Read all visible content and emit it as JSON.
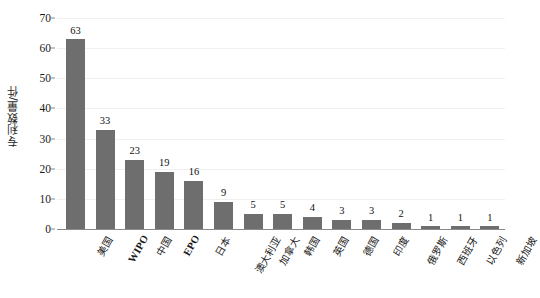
{
  "chart_data": {
    "type": "bar",
    "title": "",
    "xlabel": "",
    "ylabel": "专利数量/件",
    "ylim": [
      0,
      70
    ],
    "ytick_step": 10,
    "yticks": [
      "0",
      "10",
      "20",
      "30",
      "40",
      "50",
      "60",
      "70"
    ],
    "grid": true,
    "legend": false,
    "bar_color": "#6e6e6e",
    "categories": [
      "美国",
      "WIPO",
      "中国",
      "EPO",
      "日本",
      "澳大利亚",
      "加拿大",
      "韩国",
      "英国",
      "德国",
      "印度",
      "俄罗斯",
      "西班牙",
      "以色列",
      "新加坡"
    ],
    "values": [
      63,
      33,
      23,
      19,
      16,
      9,
      5,
      5,
      4,
      3,
      3,
      2,
      1,
      1,
      1
    ],
    "value_labels": [
      "63",
      "33",
      "23",
      "19",
      "16",
      "9",
      "5",
      "5",
      "4",
      "3",
      "3",
      "2",
      "1",
      "1",
      "1"
    ],
    "latin_categories": [
      "WIPO",
      "EPO"
    ]
  }
}
